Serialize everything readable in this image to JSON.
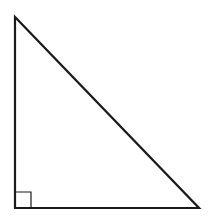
{
  "diagram": {
    "type": "right-triangle",
    "stroke_color": "#1a1a1a",
    "background": "#ffffff",
    "vertices": {
      "top": [
        15,
        17
      ],
      "bottom_left": [
        15,
        208
      ],
      "bottom_right": [
        199,
        208
      ]
    },
    "right_angle_marker": {
      "corner": "bottom_left",
      "size": 16
    }
  }
}
